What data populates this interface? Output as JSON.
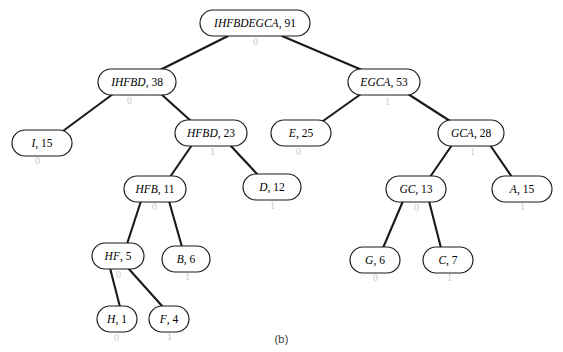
{
  "figure": {
    "caption": "(b)",
    "caption_x": 281,
    "caption_y": 333,
    "width": 563,
    "height": 352,
    "background": "#ffffff",
    "ink_color": "#1a1a1a"
  },
  "tree": {
    "nodes": [
      {
        "id": "root",
        "symbols": "IHFBDEGCA",
        "weight": "91",
        "label": "IHFBDEGCA, 91",
        "cx": 255,
        "cy": 23,
        "rx": 55,
        "ry": 13,
        "font_size": 11.5
      },
      {
        "id": "ihfbd",
        "symbols": "IHFBD",
        "weight": "38",
        "label": "IHFBD, 38",
        "cx": 137,
        "cy": 82,
        "rx": 39,
        "ry": 13,
        "font_size": 11.5
      },
      {
        "id": "egca",
        "symbols": "EGCA",
        "weight": "53",
        "label": "EGCA, 53",
        "cx": 384,
        "cy": 82,
        "rx": 36,
        "ry": 13,
        "font_size": 11.5
      },
      {
        "id": "i",
        "symbols": "I",
        "weight": "15",
        "label": "I, 15",
        "cx": 42,
        "cy": 143,
        "rx": 30,
        "ry": 13,
        "font_size": 11.5
      },
      {
        "id": "hfbd",
        "symbols": "HFBD",
        "weight": "23",
        "label": "HFBD, 23",
        "cx": 211,
        "cy": 133,
        "rx": 36,
        "ry": 13,
        "font_size": 11.5
      },
      {
        "id": "e",
        "symbols": "E",
        "weight": "25",
        "label": "E, 25",
        "cx": 301,
        "cy": 133,
        "rx": 30,
        "ry": 13,
        "font_size": 11.5
      },
      {
        "id": "gca",
        "symbols": "GCA",
        "weight": "28",
        "label": "GCA, 28",
        "cx": 471,
        "cy": 133,
        "rx": 33,
        "ry": 13,
        "font_size": 11.5
      },
      {
        "id": "hfb",
        "symbols": "HFB",
        "weight": "11",
        "label": "HFB, 11",
        "cx": 155,
        "cy": 189,
        "rx": 31,
        "ry": 13,
        "font_size": 11.5
      },
      {
        "id": "d",
        "symbols": "D",
        "weight": "12",
        "label": "D, 12",
        "cx": 272,
        "cy": 187,
        "rx": 29,
        "ry": 13,
        "font_size": 11.5
      },
      {
        "id": "gc",
        "symbols": "GC",
        "weight": "13",
        "label": "GC, 13",
        "cx": 416,
        "cy": 189,
        "rx": 30,
        "ry": 13,
        "font_size": 11.5
      },
      {
        "id": "a",
        "symbols": "A",
        "weight": "15",
        "label": "A, 15",
        "cx": 522,
        "cy": 189,
        "rx": 30,
        "ry": 13,
        "font_size": 11.5
      },
      {
        "id": "hf",
        "symbols": "HF",
        "weight": "5",
        "label": "HF, 5",
        "cx": 118,
        "cy": 256,
        "rx": 26,
        "ry": 13,
        "font_size": 11.5
      },
      {
        "id": "b",
        "symbols": "B",
        "weight": "6",
        "label": "B, 6",
        "cx": 186,
        "cy": 259,
        "rx": 24,
        "ry": 13,
        "font_size": 11.5
      },
      {
        "id": "g",
        "symbols": "G",
        "weight": "6",
        "label": "G, 6",
        "cx": 375,
        "cy": 260,
        "rx": 25,
        "ry": 13,
        "font_size": 11.5
      },
      {
        "id": "c",
        "symbols": "C",
        "weight": "7",
        "label": "C, 7",
        "cx": 448,
        "cy": 260,
        "rx": 25,
        "ry": 13,
        "font_size": 11.5
      },
      {
        "id": "h",
        "symbols": "H",
        "weight": "1",
        "label": "H, 1",
        "cx": 117,
        "cy": 319,
        "rx": 20,
        "ry": 13,
        "font_size": 11.5
      },
      {
        "id": "f",
        "symbols": "F",
        "weight": "4",
        "label": "F, 4",
        "cx": 169,
        "cy": 319,
        "rx": 20,
        "ry": 13,
        "font_size": 11.5
      }
    ],
    "edges": [
      {
        "from": "root",
        "to": "ihfbd",
        "x1": 228,
        "y1": 36,
        "x2": 160,
        "y2": 70
      },
      {
        "from": "root",
        "to": "egca",
        "x1": 282,
        "y1": 36,
        "x2": 362,
        "y2": 70
      },
      {
        "from": "ihfbd",
        "to": "i",
        "x1": 113,
        "y1": 94,
        "x2": 63,
        "y2": 131
      },
      {
        "from": "ihfbd",
        "to": "hfbd",
        "x1": 161,
        "y1": 94,
        "x2": 191,
        "y2": 121
      },
      {
        "from": "egca",
        "to": "e",
        "x1": 361,
        "y1": 94,
        "x2": 323,
        "y2": 121
      },
      {
        "from": "egca",
        "to": "gca",
        "x1": 408,
        "y1": 94,
        "x2": 450,
        "y2": 121
      },
      {
        "from": "hfbd",
        "to": "hfb",
        "x1": 192,
        "y1": 145,
        "x2": 170,
        "y2": 177
      },
      {
        "from": "hfbd",
        "to": "d",
        "x1": 230,
        "y1": 145,
        "x2": 258,
        "y2": 175
      },
      {
        "from": "gca",
        "to": "gc",
        "x1": 452,
        "y1": 145,
        "x2": 430,
        "y2": 177
      },
      {
        "from": "gca",
        "to": "a",
        "x1": 490,
        "y1": 145,
        "x2": 512,
        "y2": 177
      },
      {
        "from": "hfb",
        "to": "hf",
        "x1": 141,
        "y1": 201,
        "x2": 127,
        "y2": 244
      },
      {
        "from": "hfb",
        "to": "b",
        "x1": 169,
        "y1": 201,
        "x2": 182,
        "y2": 247
      },
      {
        "from": "gc",
        "to": "g",
        "x1": 403,
        "y1": 201,
        "x2": 383,
        "y2": 248
      },
      {
        "from": "gc",
        "to": "c",
        "x1": 429,
        "y1": 201,
        "x2": 441,
        "y2": 248
      },
      {
        "from": "hf",
        "to": "h",
        "x1": 110,
        "y1": 268,
        "x2": 120,
        "y2": 307
      },
      {
        "from": "hf",
        "to": "f",
        "x1": 128,
        "y1": 268,
        "x2": 163,
        "y2": 307
      }
    ]
  },
  "artifacts": {
    "marks": [
      {
        "glyph": "0",
        "x": 253,
        "y": 36,
        "size": 10,
        "rotate": 0
      },
      {
        "glyph": "0",
        "x": 127,
        "y": 95,
        "size": 10,
        "rotate": 0
      },
      {
        "glyph": "1",
        "x": 385,
        "y": 96,
        "size": 10,
        "rotate": 0
      },
      {
        "glyph": "0",
        "x": 35,
        "y": 155,
        "size": 10,
        "rotate": 0
      },
      {
        "glyph": "1",
        "x": 210,
        "y": 146,
        "size": 10,
        "rotate": 0
      },
      {
        "glyph": "0",
        "x": 296,
        "y": 146,
        "size": 10,
        "rotate": 0
      },
      {
        "glyph": "1",
        "x": 470,
        "y": 146,
        "size": 10,
        "rotate": 0
      },
      {
        "glyph": "0",
        "x": 152,
        "y": 201,
        "size": 10,
        "rotate": 0
      },
      {
        "glyph": "1",
        "x": 270,
        "y": 200,
        "size": 10,
        "rotate": 0
      },
      {
        "glyph": "0",
        "x": 414,
        "y": 202,
        "size": 10,
        "rotate": 0
      },
      {
        "glyph": "1",
        "x": 520,
        "y": 201,
        "size": 10,
        "rotate": 0
      },
      {
        "glyph": "0",
        "x": 116,
        "y": 269,
        "size": 10,
        "rotate": 0
      },
      {
        "glyph": "1",
        "x": 185,
        "y": 271,
        "size": 10,
        "rotate": 0
      },
      {
        "glyph": "0",
        "x": 373,
        "y": 272,
        "size": 10,
        "rotate": 0
      },
      {
        "glyph": "1",
        "x": 447,
        "y": 272,
        "size": 10,
        "rotate": 0
      },
      {
        "glyph": "0",
        "x": 114,
        "y": 332,
        "size": 10,
        "rotate": 0
      },
      {
        "glyph": "1",
        "x": 167,
        "y": 331,
        "size": 10,
        "rotate": 0
      }
    ]
  }
}
